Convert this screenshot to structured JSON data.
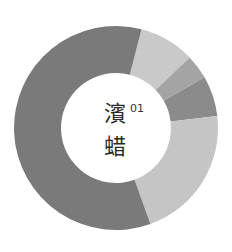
{
  "chart_data": {
    "type": "pie",
    "variant": "donut",
    "title": "",
    "center_text": [
      "濱",
      "蜡"
    ],
    "center_number": "01",
    "start_angle_deg": 14.5,
    "categories": [
      "Segment A",
      "Segment B",
      "Segment C",
      "Segment D",
      "Segment E"
    ],
    "values": [
      8.8,
      3.9,
      6.4,
      21.4,
      59.5
    ],
    "colors": [
      "#c9c9c9",
      "#a4a4a4",
      "#8b8b8b",
      "#c5c5c5",
      "#7a7a7a"
    ],
    "legend": "none",
    "geometry": {
      "cx": 116,
      "cy": 128,
      "outer_r": 102,
      "inner_r": 55
    }
  },
  "center": {
    "char1": "濱",
    "char2": "蜡",
    "number": "01"
  }
}
